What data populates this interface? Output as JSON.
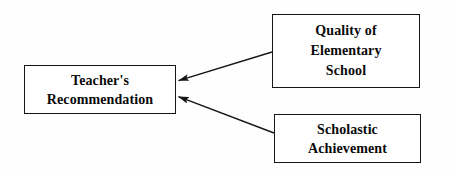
{
  "diagram": {
    "type": "path-diagram",
    "background_color": "#ffffff",
    "line_color": "#161616",
    "text_color": "#0a0a0a",
    "nodes": [
      {
        "id": "recommendation",
        "name": "teachers-recommendation",
        "lines": [
          "Teacher's",
          "Recommendation"
        ],
        "x": 24,
        "y": 65,
        "width": 152,
        "height": 49
      },
      {
        "id": "quality",
        "name": "quality-of-elementary-school",
        "lines": [
          "Quality of",
          "Elementary",
          "School"
        ],
        "x": 272,
        "y": 14,
        "width": 148,
        "height": 74
      },
      {
        "id": "achievement",
        "name": "scholastic-achievement",
        "lines": [
          "Scholastic",
          "Achievement"
        ],
        "x": 274,
        "y": 114,
        "width": 147,
        "height": 49
      }
    ],
    "arrows": [
      {
        "name": "arrow-quality-to-recommendation",
        "from": "quality",
        "to": "recommendation",
        "from_point": [
          272,
          52
        ],
        "to_point": [
          177,
          81
        ],
        "head": "filled-triangle"
      },
      {
        "name": "arrow-achievement-to-recommendation",
        "from": "achievement",
        "to": "recommendation",
        "from_point": [
          274,
          133
        ],
        "to_point": [
          177,
          96
        ],
        "head": "filled-triangle"
      }
    ]
  }
}
